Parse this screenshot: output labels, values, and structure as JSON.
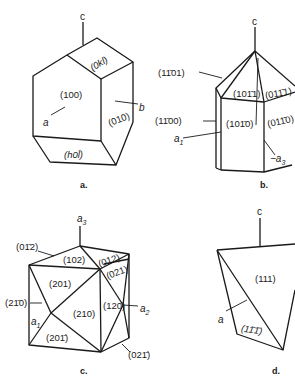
{
  "figure": {
    "panels": [
      {
        "id": "a",
        "caption": "a.",
        "axes": {
          "c": "c",
          "a": "a",
          "b": "b"
        },
        "faces": [
          "(0kl)",
          "(100)",
          "(010)",
          "(h0l̄)"
        ]
      },
      {
        "id": "b",
        "caption": "b.",
        "axes": {
          "c": "c",
          "a1": "a",
          "a1_sub": "1",
          "a3": "−a",
          "a3_sub": "3"
        },
        "faces": [
          "(11̄01)",
          "(101̄1)",
          "(011̄1)",
          "(11̄00)",
          "(101̄0)",
          "(011̄0)"
        ]
      },
      {
        "id": "c",
        "caption": "c.",
        "axes": {
          "a3": "a",
          "a3_sub": "3",
          "a1": "a",
          "a1_sub": "1",
          "a2": "a",
          "a2_sub": "2"
        },
        "faces": [
          "(01̄2)",
          "(102)",
          "(012)",
          "(021)",
          "(201)",
          "(21̄0)",
          "(210)",
          "(120)",
          "(201̄)",
          "(021̄)"
        ]
      },
      {
        "id": "d",
        "caption": "d.",
        "axes": {
          "c": "c",
          "a": "a"
        },
        "faces": [
          "(111)",
          "(11̄1̄)"
        ]
      }
    ]
  }
}
